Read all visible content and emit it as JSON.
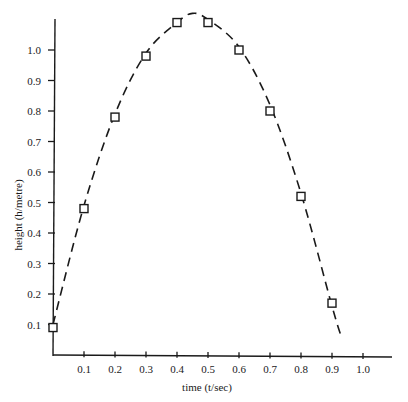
{
  "chart_data": {
    "type": "scatter",
    "title": "",
    "xlabel": "time (t/sec)",
    "ylabel": "height (h/metre)",
    "xlim": [
      0,
      1.0
    ],
    "ylim": [
      0,
      1.1
    ],
    "grid": false,
    "legend": null,
    "x_ticks": [
      "0.1",
      "0.2",
      "0.3",
      "0.4",
      "0.5",
      "0.6",
      "0.7",
      "0.8",
      "0.9",
      "1.0"
    ],
    "y_ticks": [
      "0.1",
      "0.2",
      "0.3",
      "0.4",
      "0.5",
      "0.6",
      "0.7",
      "0.8",
      "0.9",
      "1.0"
    ],
    "series": [
      {
        "name": "measured height",
        "marker": "open-square",
        "x": [
          0.0,
          0.1,
          0.2,
          0.3,
          0.4,
          0.5,
          0.6,
          0.7,
          0.8,
          0.9
        ],
        "y": [
          0.09,
          0.48,
          0.78,
          0.98,
          1.09,
          1.09,
          1.0,
          0.8,
          0.52,
          0.17
        ]
      },
      {
        "name": "fitted parabola",
        "style": "dashed-line",
        "x": [
          0.0,
          0.1,
          0.2,
          0.3,
          0.4,
          0.45,
          0.5,
          0.6,
          0.7,
          0.8,
          0.9,
          0.93
        ],
        "y": [
          0.1,
          0.49,
          0.79,
          0.99,
          1.09,
          1.12,
          1.1,
          1.01,
          0.82,
          0.53,
          0.16,
          0.06
        ]
      }
    ]
  }
}
